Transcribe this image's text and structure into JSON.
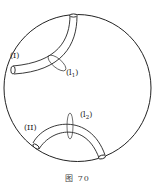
{
  "figure": {
    "caption": "图 70",
    "region": {
      "shape": "circle",
      "stroke": "#222222"
    },
    "tubes": [
      {
        "id": "I",
        "label": "(I)",
        "loop": {
          "label_base": "(l",
          "label_sub": "1",
          "label_close": ")"
        }
      },
      {
        "id": "II",
        "label": "(II)",
        "loop": {
          "label_base": "(l",
          "label_sub": "2",
          "label_close": ")"
        }
      }
    ]
  }
}
